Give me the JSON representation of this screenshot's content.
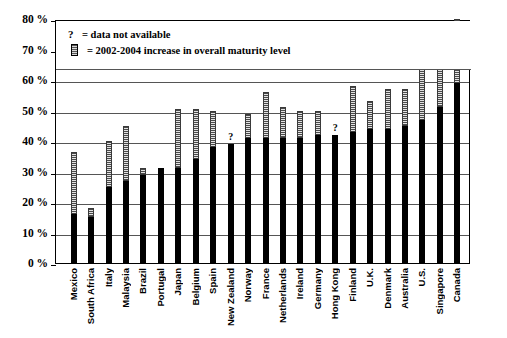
{
  "legend": {
    "qmark_symbol": "?",
    "qmark_text": "= data not available",
    "swatch_text": "= 2002-2004 increase in overall maturity level"
  },
  "axis": {
    "yticks": [
      "0 %",
      "10 %",
      "20 %",
      "30 %",
      "40 %",
      "50 %",
      "60 %",
      "70 %",
      "80 %"
    ]
  },
  "chart_data": {
    "type": "bar",
    "subtype": "stacked",
    "title": "",
    "xlabel": "",
    "ylabel": "",
    "ylim": [
      0,
      80
    ],
    "ytick_values": [
      0,
      10,
      20,
      30,
      40,
      50,
      60,
      70,
      80
    ],
    "ytick_labels": [
      "0 %",
      "10 %",
      "20 %",
      "30 %",
      "40 %",
      "50 %",
      "60 %",
      "70 %",
      "80 %"
    ],
    "grid": true,
    "legend_position": "top-inside",
    "categories": [
      "Mexico",
      "South Africa",
      "Italy",
      "Malaysia",
      "Brazil",
      "Portugal",
      "Japan",
      "Belgium",
      "Spain",
      "New Zealand",
      "Norway",
      "France",
      "Netherlands",
      "Ireland",
      "Germany",
      "Hong Kong",
      "Finland",
      "U.K.",
      "Denmark",
      "Australia",
      "U.S.",
      "Singapore",
      "Canada"
    ],
    "series": [
      {
        "name": "2002 overall maturity level",
        "values": [
          16,
          15,
          25,
          27,
          29,
          31,
          31,
          34,
          38,
          39,
          41,
          41,
          41,
          41,
          42,
          42,
          43,
          44,
          44,
          45,
          47,
          51,
          59
        ]
      },
      {
        "name": "2002-2004 increase in overall maturity level",
        "values": [
          20.5,
          3,
          15,
          18,
          2,
          0,
          19.5,
          16.5,
          12,
          0,
          8,
          15,
          10,
          9,
          8,
          0,
          15,
          9,
          13,
          12,
          19,
          15,
          21
        ]
      }
    ],
    "totals": [
      36.5,
      18,
      40,
      45,
      31,
      31,
      50.5,
      50.5,
      50,
      39,
      49,
      56,
      51,
      50,
      50,
      42,
      58,
      53,
      57,
      57,
      66,
      66,
      80
    ],
    "annotations": [
      {
        "category": "New Zealand",
        "text": "?",
        "meaning": "data not available"
      },
      {
        "category": "Hong Kong",
        "text": "?",
        "meaning": "data not available"
      }
    ],
    "legend_entries": [
      "? = data not available",
      "= 2002-2004 increase in overall maturity level"
    ]
  },
  "colors": {
    "base_bar": "#000000",
    "increase_bar": "#4a4a4a",
    "gridline": "#555555",
    "frame": "#000000",
    "background": "#ffffff"
  }
}
